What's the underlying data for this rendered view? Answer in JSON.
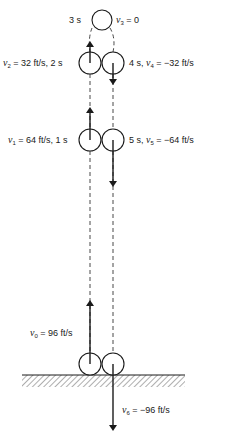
{
  "diagram": {
    "type": "vertical-projectile-motion",
    "colors": {
      "stroke": "#1a1a1a",
      "background": "#ffffff"
    },
    "states": [
      {
        "id": "v0",
        "symbol": "v",
        "sub": "0",
        "text": "= 96 ft/s"
      },
      {
        "id": "v1",
        "symbol": "v",
        "sub": "1",
        "text": "= 64 ft/s, 1 s"
      },
      {
        "id": "v2",
        "symbol": "v",
        "sub": "2",
        "text": "= 32 ft/s, 2 s"
      },
      {
        "id": "v3",
        "prefix": "3 s",
        "symbol": "v",
        "sub": "3",
        "text": "= 0"
      },
      {
        "id": "v4",
        "prefix": "4 s,",
        "symbol": "v",
        "sub": "4",
        "text": "= −32 ft/s"
      },
      {
        "id": "v5",
        "prefix": "5 s,",
        "symbol": "v",
        "sub": "5",
        "text": "= −64 ft/s"
      },
      {
        "id": "v6",
        "symbol": "v",
        "sub": "6",
        "text": "= −96 ft/s"
      }
    ]
  }
}
